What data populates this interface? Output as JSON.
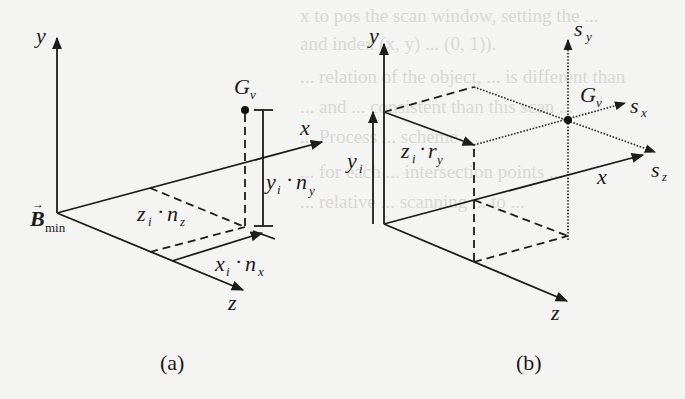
{
  "figure": {
    "panel_a": {
      "caption": "(a)",
      "axes": {
        "x": "x",
        "y": "y",
        "z": "z"
      },
      "origin_label": {
        "base": "B",
        "subscript": "min",
        "vector_arrow": "→"
      },
      "point_label": {
        "base": "G",
        "subscript": "v"
      },
      "annotations": {
        "y_term": {
          "a": "y",
          "a_sub": "i",
          "op": "·",
          "b": "n",
          "b_sub": "y"
        },
        "z_term": {
          "a": "z",
          "a_sub": "i",
          "op": "·",
          "b": "n",
          "b_sub": "z"
        },
        "x_term": {
          "a": "x",
          "a_sub": "i",
          "op": "·",
          "b": "n",
          "b_sub": "x"
        }
      }
    },
    "panel_b": {
      "caption": "(b)",
      "axes": {
        "x": "x",
        "y": "y",
        "z": "z"
      },
      "scan_axes": {
        "sy": {
          "base": "s",
          "subscript": "y"
        },
        "sx": {
          "base": "s",
          "subscript": "x"
        },
        "sz": {
          "base": "s",
          "subscript": "z"
        }
      },
      "point_label": {
        "base": "G",
        "subscript": "v"
      },
      "annotations": {
        "yi": {
          "a": "y",
          "a_sub": "i"
        },
        "z_term": {
          "a": "z",
          "a_sub": "i",
          "op": "·",
          "b": "r",
          "b_sub": "y"
        }
      }
    },
    "background_bleed_text": [
      "x to pos the scan window, setting the ...",
      "and index (x, y) ... (0, 1)).",
      "... relation of the object, ... is different than",
      "... and ... consistent than this scan ...",
      "... Process ... scheme",
      "... for each ... intersection points ...",
      "... relative ... scanning ... to ..."
    ]
  }
}
